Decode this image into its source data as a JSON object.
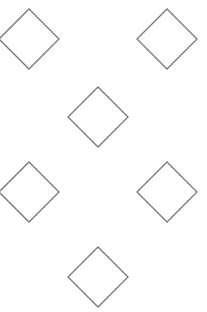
{
  "canvas": {
    "width": 207,
    "height": 312,
    "background": "#ffffff"
  },
  "style": {
    "stroke": "#777777",
    "stroke_width": 1.3,
    "fill": "#ffffff"
  },
  "shapes": [
    {
      "name": "diamond-top-left",
      "type": "diamond",
      "cx": 29,
      "cy": 39,
      "r": 30
    },
    {
      "name": "diamond-top-right",
      "type": "diamond",
      "cx": 167,
      "cy": 39,
      "r": 30
    },
    {
      "name": "diamond-center",
      "type": "diamond",
      "cx": 98,
      "cy": 117,
      "r": 30
    },
    {
      "name": "diamond-lower-left",
      "type": "diamond",
      "cx": 29,
      "cy": 192,
      "r": 30
    },
    {
      "name": "diamond-lower-right",
      "type": "diamond",
      "cx": 167,
      "cy": 192,
      "r": 30
    },
    {
      "name": "diamond-bottom-center",
      "type": "diamond",
      "cx": 98,
      "cy": 277,
      "r": 30
    }
  ]
}
